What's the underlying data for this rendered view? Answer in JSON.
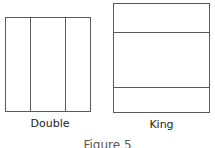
{
  "figure": {
    "caption": "Figure 5",
    "stroke_color": "#5a5a5a",
    "fill_color": "#ffffff",
    "text_color": "#1d1d1d"
  },
  "beds": [
    {
      "id": "double",
      "label": "Double",
      "orientation": "vertical-panels",
      "panel_count": 3,
      "divider_count": 2
    },
    {
      "id": "king",
      "label": "King",
      "orientation": "horizontal-panels",
      "panel_count": 3,
      "divider_count": 2
    }
  ]
}
